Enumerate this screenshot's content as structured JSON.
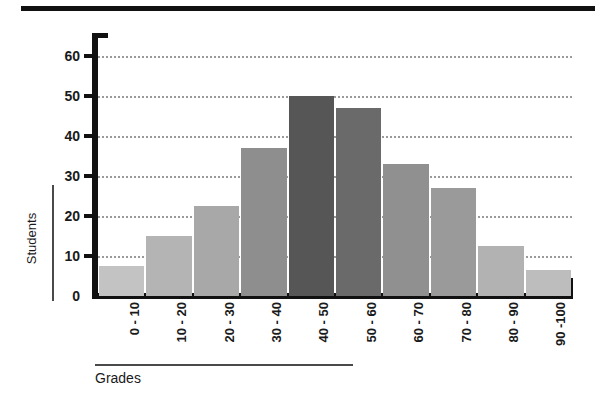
{
  "chart_data": {
    "type": "bar",
    "title": "",
    "subtitle": "",
    "xlabel": "Grades",
    "ylabel": "Students",
    "categories": [
      "0 - 10",
      "10 - 20",
      "20 - 30",
      "30 - 40",
      "40 - 50",
      "50 - 60",
      "60 - 70",
      "70 - 80",
      "80 - 90",
      "90 -100"
    ],
    "values": [
      7.5,
      15,
      22.5,
      37,
      50,
      47,
      33,
      27,
      12.5,
      6.5
    ],
    "bar_colors": [
      "#c3c3c3",
      "#b4b4b4",
      "#a8a8a8",
      "#8e8e8e",
      "#565656",
      "#6a6a6a",
      "#909090",
      "#9a9a9a",
      "#b2b2b2",
      "#bdbdbd"
    ],
    "ylim": [
      0,
      65
    ],
    "ytick_values": [
      0,
      10,
      20,
      30,
      40,
      50,
      60
    ],
    "ytick_labels": [
      "0",
      "10",
      "20",
      "30",
      "40",
      "50",
      "60"
    ],
    "gridlines": [
      10,
      20,
      30,
      40,
      50,
      60
    ],
    "grid": true,
    "grid_style": "dotted",
    "grid_color": "#9a9a9a",
    "legend": false,
    "legend_position": "none",
    "axis_color": "#111111",
    "background_color": "#ffffff"
  },
  "decor": {
    "top_rule": "",
    "xlabel_rule": "",
    "ylabel_rule": ""
  }
}
